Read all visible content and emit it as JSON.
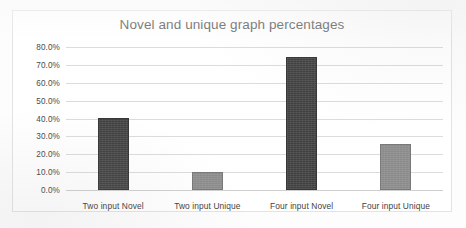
{
  "chart_data": {
    "type": "bar",
    "title": "Novel and unique graph percentages",
    "xlabel": "",
    "ylabel": "",
    "categories": [
      "Two input Novel",
      "Two input Unique",
      "Four input Novel",
      "Four input Unique"
    ],
    "values": [
      40.3,
      9.8,
      74.5,
      25.5
    ],
    "value_labels": [
      "40.3%",
      "9.8%",
      "74.5%",
      "25.5%"
    ],
    "bar_colors": [
      "#3f3f3f",
      "#8a8a8a",
      "#3f3f3f",
      "#8a8a8a"
    ],
    "ylim": [
      0,
      80
    ],
    "ytick_values": [
      80,
      70,
      60,
      50,
      40,
      30,
      20,
      10,
      0
    ],
    "ytick_labels": [
      "80.0%",
      "70.0%",
      "60.0%",
      "50.0%",
      "40.0%",
      "30.0%",
      "20.0%",
      "10.0%",
      "0.0%"
    ],
    "grid": true,
    "legend": false,
    "legend_position": "none",
    "title_color": "#5d5d5d",
    "gridline_color": "#dcdcdc",
    "background_color": "#ffffff"
  }
}
